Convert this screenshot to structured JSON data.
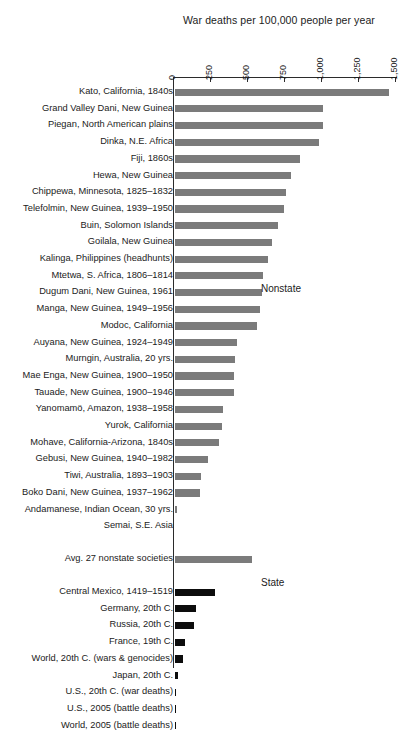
{
  "chart_data": {
    "type": "bar",
    "orientation": "horizontal",
    "title": "War deaths per 100,000 people per year",
    "xlabel": "",
    "ylabel": "",
    "xlim": [
      0,
      1500
    ],
    "grid": false,
    "ticks": [
      0,
      250,
      500,
      750,
      1000,
      1250,
      1500
    ],
    "tick_labels": [
      "0",
      "250",
      "500",
      "750",
      "1,000",
      "1,250",
      "1,500"
    ],
    "legend_position": "none",
    "group_labels": {
      "nonstate": "Nonstate",
      "state": "State"
    },
    "colors": {
      "nonstate": "#7b7b7b",
      "state": "#0d0d0d",
      "axis": "#2b2b2b",
      "background": "#ffffff"
    },
    "categories": [
      "Kato, California, 1840s",
      "Grand Valley Dani, New Guinea",
      "Piegan, North American plains",
      "Dinka, N.E. Africa",
      "Fiji, 1860s",
      "Hewa, New Guinea",
      "Chippewa, Minnesota, 1825–1832",
      "Telefolmin, New Guinea, 1939–1950",
      "Buin, Solomon Islands",
      "Goilala, New Guinea",
      "Kalinga, Philippines (headhunts)",
      "Mtetwa, S. Africa, 1806–1814",
      "Dugum Dani, New Guinea, 1961",
      "Manga, New Guinea, 1949–1956",
      "Modoc, California",
      "Auyana, New Guinea, 1924–1949",
      "Murngin, Australia, 20 yrs.",
      "Mae Enga, New Guinea, 1900–1950",
      "Tauade, New Guinea, 1900–1946",
      "Yanomamö, Amazon, 1938–1958",
      "Yurok, California",
      "Mohave, California-Arizona, 1840s",
      "Gebusi, New Guinea, 1940–1982",
      "Tiwi,  Australia, 1893–1903",
      "Boko Dani, New Guinea, 1937–1962",
      "Andamanese, Indian Ocean, 30 yrs.",
      "Semai, S.E. Asia",
      "Avg. 27 nonstate societies",
      "Central Mexico, 1419–1519",
      "Germany, 20th C.",
      "Russia, 20th C.",
      "France, 19th C.",
      "World, 20th C. (wars & genocides)",
      "Japan, 20th C.",
      "U.S., 20th C. (war deaths)",
      "U.S., 2005 (battle deaths)",
      "World, 2005 (battle deaths)"
    ],
    "values": [
      1450,
      1000,
      1000,
      975,
      850,
      790,
      750,
      740,
      700,
      660,
      630,
      600,
      590,
      580,
      560,
      420,
      410,
      405,
      400,
      330,
      320,
      300,
      225,
      180,
      170,
      20,
      0,
      524,
      277,
      144,
      135,
      70,
      60,
      27,
      5,
      0.5,
      0.3
    ],
    "bar_groups": [
      "nonstate",
      "nonstate",
      "nonstate",
      "nonstate",
      "nonstate",
      "nonstate",
      "nonstate",
      "nonstate",
      "nonstate",
      "nonstate",
      "nonstate",
      "nonstate",
      "nonstate",
      "nonstate",
      "nonstate",
      "nonstate",
      "nonstate",
      "nonstate",
      "nonstate",
      "nonstate",
      "nonstate",
      "nonstate",
      "nonstate",
      "nonstate",
      "nonstate",
      "nonstate",
      "nonstate",
      "nonstate",
      "state",
      "state",
      "state",
      "state",
      "state",
      "state",
      "state",
      "state",
      "state"
    ],
    "row_tops": [
      86,
      102.7,
      119.4,
      136.1,
      152.8,
      169.5,
      186.2,
      202.9,
      219.6,
      236.3,
      253,
      269.7,
      286.4,
      303.1,
      319.8,
      336.5,
      353.2,
      369.9,
      386.6,
      403.3,
      420,
      436.7,
      453.4,
      470.1,
      486.8,
      503.5,
      520.2,
      553,
      586,
      602.7,
      619.4,
      636.1,
      652.8,
      669.5,
      686.2,
      702.9,
      719.6
    ]
  }
}
